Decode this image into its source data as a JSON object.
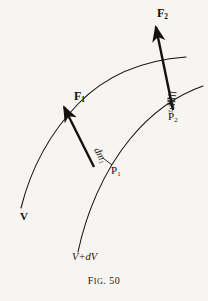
{
  "figure": {
    "caption_prefix": "F",
    "caption_smallcaps": "IG",
    "caption_suffix": ". 50",
    "caption_full": "FIG. 50",
    "background_color": "#f6f5f1",
    "ink_color": "#141210"
  },
  "labels": {
    "force_upper": {
      "symbol": "F",
      "subscript": "2",
      "text": "F2"
    },
    "force_lower": {
      "symbol": "F",
      "subscript": "1",
      "text": "F1"
    },
    "mass_lower": {
      "symbol": "dm",
      "subscript": "1",
      "text": "dm1"
    },
    "mass_upper": {
      "symbol": "dm",
      "subscript": "2",
      "text": "dm2"
    },
    "point_lower": {
      "symbol": "P",
      "subscript": "1",
      "text": "P1"
    },
    "point_upper": {
      "symbol": "P",
      "subscript": "2",
      "text": "P2"
    },
    "velocity_inner": {
      "text": "V"
    },
    "velocity_outer": {
      "text": "V+dV"
    }
  },
  "geometry": {
    "arc_inner": "M 21,208 C 30,172 48,135 78,104 C 108,73 145,60 186,57",
    "arc_outer": "M 78,252 C 86,214 103,172 130,139 C 153,111 180,94 203,86",
    "vector_F2": {
      "x1": 173,
      "y1": 110,
      "x2": 154,
      "y2": 18
    },
    "vector_F1": {
      "x1": 94,
      "y1": 167,
      "x2": 60,
      "y2": 99
    },
    "segment_dm1": {
      "x1": 94,
      "y1": 167,
      "x2": 112,
      "y2": 164
    },
    "segment_dm2": {
      "x1": 173,
      "y1": 110,
      "x2": 170,
      "y2": 112
    }
  }
}
